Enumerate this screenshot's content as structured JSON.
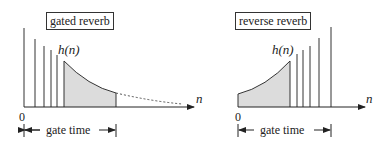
{
  "left_panel": {
    "title": "gated reverb",
    "curve_label": "h(n)",
    "axis_label": "n",
    "origin_label": "0",
    "gate_label": "gate time"
  },
  "right_panel": {
    "title": "reverse reverb",
    "curve_label": "h(n)",
    "axis_label": "n",
    "origin_label": "0",
    "gate_label": "gate time"
  },
  "colors": {
    "line": "#333333",
    "shade": "#dcdcdc"
  }
}
